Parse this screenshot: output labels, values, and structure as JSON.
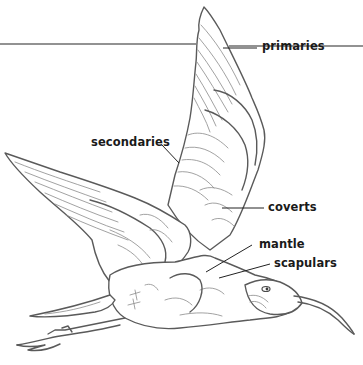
{
  "diagram": {
    "colors": {
      "background": "#ffffff",
      "drawing_stroke": "#5a5a5a",
      "label_text": "#1a1a1a",
      "leader_line": "#222222",
      "rule_line": "#6e6e6e"
    },
    "labels": [
      {
        "id": "primaries",
        "text": "primaries",
        "x": 262,
        "y": 39
      },
      {
        "id": "secondaries",
        "text": "secondaries",
        "x": 92,
        "y": 136
      },
      {
        "id": "coverts",
        "text": "coverts",
        "x": 268,
        "y": 200
      },
      {
        "id": "mantle",
        "text": "mantle",
        "x": 259,
        "y": 239
      },
      {
        "id": "scapulars",
        "text": "scapulars",
        "x": 274,
        "y": 258
      }
    ]
  }
}
